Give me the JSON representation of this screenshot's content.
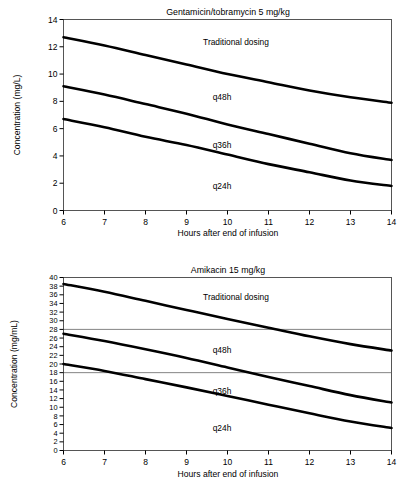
{
  "chart_data": [
    {
      "type": "line",
      "title": "Gentamicin/tobramycin 5 mg/kg",
      "xlabel": "Hours after end of infusion",
      "ylabel": "Concentration (mg/L)",
      "xlim": [
        6,
        14
      ],
      "ylim": [
        0,
        14
      ],
      "xticks": [
        6,
        7,
        8,
        9,
        10,
        11,
        12,
        13,
        14
      ],
      "yticks": [
        0,
        2,
        4,
        6,
        8,
        10,
        12,
        14
      ],
      "grid": false,
      "legend": "inline-annotations",
      "x": [
        6,
        7,
        8,
        9,
        10,
        11,
        12,
        13,
        14
      ],
      "series": [
        {
          "name": "Traditional dosing",
          "values": [
            12.7,
            12.1,
            11.4,
            10.7,
            10.0,
            9.4,
            8.8,
            8.3,
            7.9
          ]
        },
        {
          "name": "q48h",
          "values": [
            9.1,
            8.5,
            7.8,
            7.1,
            6.3,
            5.6,
            4.9,
            4.2,
            3.7
          ]
        },
        {
          "name": "q36h",
          "values": [
            6.7,
            6.1,
            5.4,
            4.8,
            4.1,
            3.4,
            2.8,
            2.2,
            1.8
          ]
        }
      ],
      "annotations": [
        {
          "text": "Traditional dosing",
          "x": 9.8,
          "y": 12.3
        },
        {
          "text": "q48h",
          "x": 9.4,
          "y": 8.2
        },
        {
          "text": "q36h",
          "x": 9.4,
          "y": 4.7
        },
        {
          "text": "q24h",
          "x": 9.4,
          "y": 1.7
        }
      ]
    },
    {
      "type": "line",
      "title": "Amikacin 15 mg/kg",
      "xlabel": "Hours after end of infusion",
      "ylabel": "Concentration (mg/mL)",
      "xlim": [
        6,
        14
      ],
      "ylim": [
        0,
        40
      ],
      "xticks": [
        6,
        7,
        8,
        9,
        10,
        11,
        12,
        13,
        14
      ],
      "yticks": [
        0,
        2,
        4,
        6,
        8,
        10,
        12,
        14,
        16,
        18,
        20,
        22,
        24,
        26,
        28,
        30,
        32,
        34,
        36,
        38,
        40
      ],
      "grid": false,
      "reference_lines": [
        28,
        18
      ],
      "legend": "inline-annotations",
      "x": [
        6,
        7,
        8,
        9,
        10,
        11,
        12,
        13,
        14
      ],
      "series": [
        {
          "name": "Traditional dosing",
          "values": [
            38.5,
            36.7,
            34.6,
            32.5,
            30.4,
            28.4,
            26.4,
            24.6,
            23.1
          ]
        },
        {
          "name": "q48h",
          "values": [
            27.0,
            25.3,
            23.4,
            21.4,
            19.2,
            17.0,
            14.9,
            12.8,
            11.1
          ]
        },
        {
          "name": "q36h",
          "values": [
            20.0,
            18.4,
            16.5,
            14.6,
            12.6,
            10.6,
            8.6,
            6.7,
            5.2
          ]
        }
      ],
      "annotations": [
        {
          "text": "Traditional dosing",
          "x": 9.8,
          "y": 35.4
        },
        {
          "text": "q48h",
          "x": 9.4,
          "y": 23.3
        },
        {
          "text": "q36h",
          "x": 9.4,
          "y": 13.8
        },
        {
          "text": "q24h",
          "x": 9.4,
          "y": 6.2
        }
      ]
    }
  ],
  "top": {
    "title": "Gentamicin/tobramycin 5 mg/kg",
    "xlabel": "Hours after end of infusion",
    "ylabel": "Concentration (mg/L)",
    "labels": {
      "traditional": "Traditional dosing",
      "q48h": "q48h",
      "q36h": "q36h",
      "q24h": "q24h"
    }
  },
  "bottom": {
    "title": "Amikacin 15 mg/kg",
    "xlabel": "Hours after end of infusion",
    "ylabel": "Concentration (mg/mL)",
    "labels": {
      "traditional": "Traditional dosing",
      "q48h": "q48h",
      "q36h": "q36h",
      "q24h": "q24h"
    }
  }
}
